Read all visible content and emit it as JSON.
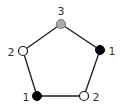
{
  "diagram": {
    "type": "pentagon-graph",
    "vertices": [
      {
        "id": "top",
        "label": "3",
        "fill": "#aaaaaa",
        "x": 61,
        "y": 24,
        "lx": 61,
        "ly": 15
      },
      {
        "id": "right",
        "label": "1",
        "fill": "#000000",
        "x": 100,
        "y": 50,
        "lx": 112,
        "ly": 55
      },
      {
        "id": "bottom-right",
        "label": "2",
        "fill": "#ffffff",
        "x": 84,
        "y": 96,
        "lx": 96,
        "ly": 101
      },
      {
        "id": "bottom-left",
        "label": "1",
        "fill": "#000000",
        "x": 37,
        "y": 96,
        "lx": 26,
        "ly": 101
      },
      {
        "id": "left",
        "label": "2",
        "fill": "#ffffff",
        "x": 23,
        "y": 51,
        "lx": 11,
        "ly": 56
      }
    ],
    "edges": [
      [
        "top",
        "right"
      ],
      [
        "right",
        "bottom-right"
      ],
      [
        "bottom-right",
        "bottom-left"
      ],
      [
        "bottom-left",
        "left"
      ],
      [
        "left",
        "top"
      ]
    ]
  }
}
